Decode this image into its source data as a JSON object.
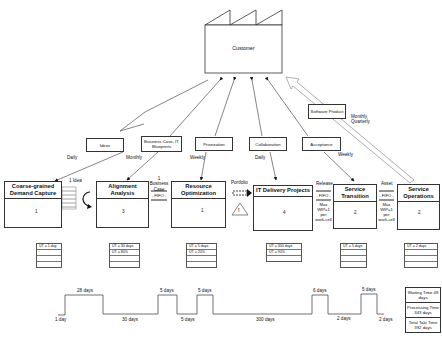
{
  "customer": {
    "label": "Customer"
  },
  "information_flows": [
    {
      "id": "ideas",
      "label": "Ideas",
      "frequency": "Daily"
    },
    {
      "id": "business-case",
      "label": "Business Case, IT Blueprints",
      "frequency": "Monthly"
    },
    {
      "id": "priorization",
      "label": "Priorization",
      "frequency": "Weekly"
    },
    {
      "id": "collaboration",
      "label": "Collaboration",
      "frequency": "Daily"
    },
    {
      "id": "acceptance",
      "label": "Acceptance",
      "frequency": "Weekly"
    },
    {
      "id": "software-product",
      "label": "Software Product",
      "frequency": "Monthly, Quarterly"
    }
  ],
  "processes": [
    {
      "id": "coarse-grained-demand-capture",
      "title": "Coarse-grained Demand Capture",
      "operators": "1",
      "data": [
        "UT = 1 day",
        "",
        "",
        ""
      ]
    },
    {
      "id": "alignment-analysis",
      "title": "Alignment Analysis",
      "operators": "3",
      "data": [
        "UT = 30 days",
        "UT = 80%",
        "",
        ""
      ]
    },
    {
      "id": "resource-optimization",
      "title": "Resource Optimization",
      "operators": "1",
      "data": [
        "UT = 5 days",
        "UT = 20%",
        "",
        ""
      ]
    },
    {
      "id": "it-delivery-projects",
      "title": "IT Delivery Projects",
      "operators": "4",
      "data": [
        "UT = 300 days",
        "UT = 90%",
        ""
      ]
    },
    {
      "id": "service-transition",
      "title": "Service Transition",
      "operators": "2",
      "data": [
        "UT = 5 days",
        "",
        "",
        ""
      ]
    },
    {
      "id": "service-operations",
      "title": "Service Operations",
      "operators": "2",
      "data": [
        "UT = 2 days",
        "",
        "",
        ""
      ]
    }
  ],
  "between": {
    "inventory_label": "1 Idea",
    "business_case_label": "1 Business Case",
    "fifo1": "- FIFO -",
    "portfolio_label": "Portfolio",
    "release_label": "Release",
    "fifo2": "- FIFO -",
    "wip1": "Max WIP=1 per work-cell",
    "asset_label": "Asset",
    "fifo3": "- FIFO -",
    "wip2": "Max WIP=1 per work-cell",
    "warning": "!"
  },
  "timeline": {
    "upper": [
      "28 days",
      "5 days",
      "5 days",
      "6 days",
      "5 days"
    ],
    "lower": [
      "1 day",
      "30 days",
      "5 days",
      "300 days",
      "2 days",
      "2 days"
    ]
  },
  "summary": {
    "waiting": "Waiting Time 48 days",
    "processing": "Processing Time 343 days",
    "total": "Total Takt Time 392 days"
  }
}
